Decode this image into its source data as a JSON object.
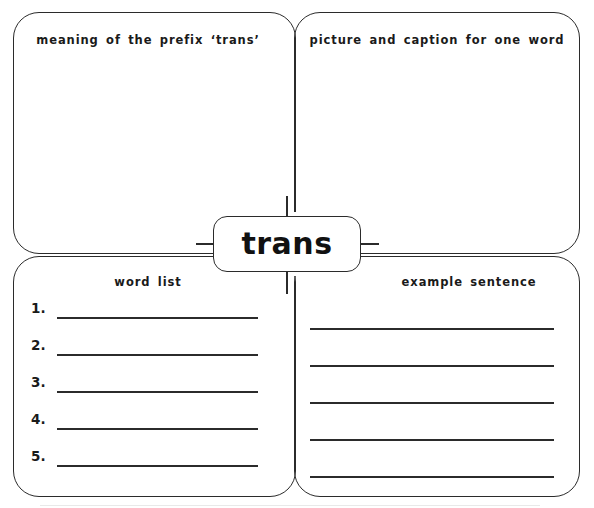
{
  "worksheet": {
    "center_word": "trans",
    "quadrants": [
      {
        "id": "meaning",
        "label": "meaning of the prefix ‘trans’",
        "position": "top-left",
        "content_type": "blank-writing-space"
      },
      {
        "id": "picture",
        "label": "picture and caption for one word",
        "position": "top-right",
        "content_type": "blank-drawing-space"
      },
      {
        "id": "wordlist",
        "label": "word list",
        "position": "bottom-left",
        "content_type": "numbered-lines"
      },
      {
        "id": "sentence",
        "label": "example sentence",
        "position": "bottom-right",
        "content_type": "ruled-lines"
      }
    ],
    "word_list": {
      "label": "word list",
      "rows": [
        {
          "number": "1.",
          "value": ""
        },
        {
          "number": "2.",
          "value": ""
        },
        {
          "number": "3.",
          "value": ""
        },
        {
          "number": "4.",
          "value": ""
        },
        {
          "number": "5.",
          "value": ""
        }
      ]
    },
    "example_sentence": {
      "label": "example sentence",
      "rows": [
        {
          "value": ""
        },
        {
          "value": ""
        },
        {
          "value": ""
        },
        {
          "value": ""
        },
        {
          "value": ""
        }
      ]
    },
    "colors": {
      "ink": "#2b2b2b",
      "text": "#1a1a1a",
      "paper": "#ffffff"
    }
  }
}
